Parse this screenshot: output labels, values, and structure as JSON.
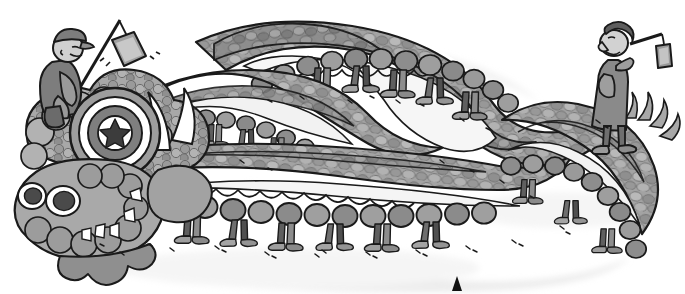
{
  "illustration": {
    "title": "Chinese dragon dance parade",
    "alt_description": "Cartoon line illustration of a long serpentine Chinese dragon costume winding in an S-curve, carried by many pairs of human legs underneath; a man in a cap rides at the dragon head holding a pole with a hanging lantern, and a woman on the right holds a stick with a hanging pouch near the dragon tail.",
    "canvas": {
      "width": 685,
      "height": 294
    },
    "style": "grayscale cartoon, black ink outline, flat gray washes, soft drop shadow"
  },
  "palette": {
    "background": "#ffffff",
    "ink": "#1a1a1a",
    "scale_mid": "#9a9a9a",
    "scale_dark": "#7d7d7d",
    "scale_light": "#c9c9c9",
    "body_fill": "#b5b5b5",
    "belly_light": "#f0f0f0",
    "shadow": "#e9e9e9",
    "fur_gray": "#a6a6a6",
    "fur_dark": "#8c8c8c",
    "cloth_dark": "#6f6f6f",
    "cloth_mid": "#8f8f8f",
    "shoe_gray": "#9e9e9e",
    "skin": "#d8d8d8",
    "white": "#ffffff",
    "marker_black": "#111111"
  },
  "elements": {
    "dragon_head": {
      "label": "Dragon head",
      "medallion": {
        "label": "Star medallion",
        "rings": 4,
        "star_points": 5
      },
      "horns": {
        "label": "Horns",
        "count": 2,
        "color": "#ffffff"
      },
      "eyes": {
        "label": "Eyes",
        "count": 2
      },
      "teeth": {
        "label": "Teeth",
        "count": 5
      },
      "fur": {
        "label": "Curly mane fur"
      }
    },
    "dragon_body": {
      "label": "Dragon body",
      "shape": "S-curve serpentine",
      "scale_rows": 3,
      "fringe_circles": 48,
      "scallop_count": 30
    },
    "dragon_tail": {
      "label": "Dragon tail",
      "tufts": 4
    },
    "carriers": {
      "label": "Dancer legs under the dragon",
      "pairs": 14
    },
    "man_on_head": {
      "label": "Man riding the dragon head",
      "hat": "flat cap",
      "holds": "pole with hanging lantern",
      "lantern": {
        "label": "Hanging lantern"
      }
    },
    "woman_right": {
      "label": "Woman beside the dragon tail",
      "garment": "long dress",
      "holds": "stick with hanging pouch",
      "pouch": {
        "label": "Hanging pouch"
      }
    },
    "ground_marker": {
      "label": "Black triangle marker",
      "shape": "triangle",
      "position": {
        "x": 457,
        "y": 284
      }
    },
    "ground_specks": {
      "label": "Ground dust specks",
      "count": 40
    }
  }
}
